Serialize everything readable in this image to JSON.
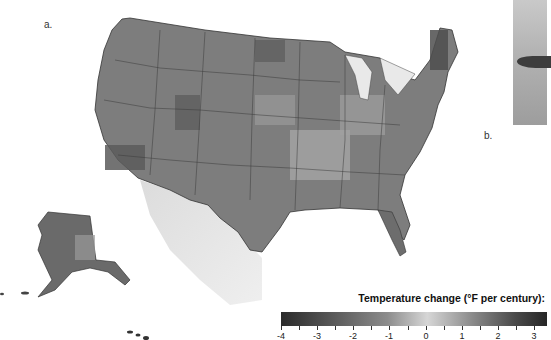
{
  "figure": {
    "panel_a_label": "a.",
    "panel_b_label": "b."
  },
  "legend": {
    "title": "Temperature change (°F per century):",
    "ticks": [
      "-4",
      "-3",
      "-2",
      "-1",
      "0",
      "1",
      "2",
      "3"
    ],
    "color_low": "#2b2b2b",
    "color_mid": "#d6d6d6",
    "color_high": "#262626"
  },
  "map": {
    "subject": "Contiguous United States, Alaska and Hawaii shaded by temperature change",
    "style": "grayscale choropleth with state borders and shaded-relief Mexico"
  }
}
